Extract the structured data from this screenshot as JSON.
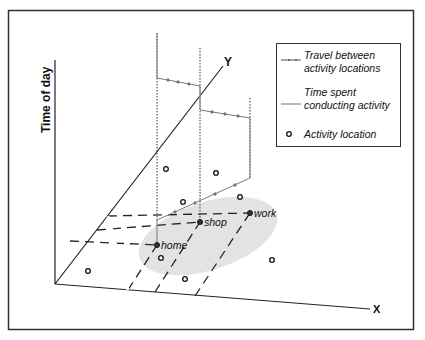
{
  "figure": {
    "axes": {
      "vertical_label": "Time of day",
      "y_label": "Y",
      "x_label": "X"
    },
    "places": [
      {
        "label": "home",
        "x": 157,
        "y": 245
      },
      {
        "label": "shop",
        "x": 200,
        "y": 222
      },
      {
        "label": "work",
        "x": 250,
        "y": 213
      }
    ],
    "other_locations": [
      [
        88,
        271
      ],
      [
        161,
        258
      ],
      [
        185,
        279
      ],
      [
        272,
        260
      ],
      [
        166,
        169
      ],
      [
        216,
        173
      ],
      [
        183,
        202
      ],
      [
        240,
        197
      ]
    ],
    "legend": {
      "items": [
        {
          "icon": "travel-arrow-icon",
          "line1": "Travel between",
          "line2": "activity locations"
        },
        {
          "icon": "time-spent-line-icon",
          "line1": "Time spent",
          "line2": "conducting activity"
        },
        {
          "icon": "activity-location-icon",
          "line1": "Activity location",
          "line2": ""
        }
      ]
    },
    "colors": {
      "axis": "#222222",
      "activity_line": "#8a8a8a",
      "ellipse": "#e2e2e2",
      "dashed": "#222222"
    }
  }
}
